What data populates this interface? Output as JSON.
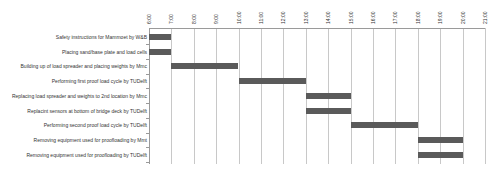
{
  "chart_data": {
    "type": "bar",
    "subtype": "gantt",
    "title": "",
    "xlabel": "",
    "ylabel": "",
    "x_ticks": [
      "6:00",
      "7:00",
      "8:00",
      "9:00",
      "10:00",
      "11:00",
      "12:00",
      "13:00",
      "14:00",
      "15:00",
      "16:00",
      "17:00",
      "18:00",
      "19:00",
      "20:00",
      "21:00"
    ],
    "xlim": [
      6,
      21
    ],
    "grid": true,
    "legend": null,
    "bar_color": "#5a5a5a",
    "tasks": [
      {
        "label": "Safety instructions for Mammoet by W&B",
        "start": 6,
        "end": 7
      },
      {
        "label": "Placing sand/base plate and load cells",
        "start": 6,
        "end": 7
      },
      {
        "label": "Building up of load spreader and placing weights by Mmc",
        "start": 7,
        "end": 10
      },
      {
        "label": "Performing first proof load cycle by TUDelft",
        "start": 10,
        "end": 13
      },
      {
        "label": "Replacing load spreader and weights to 2nd location by Mmc",
        "start": 13,
        "end": 15
      },
      {
        "label": "Replacint sensors at bottom of bridge deck by TUDelft",
        "start": 13,
        "end": 15
      },
      {
        "label": "Performing second proof load cycle by TUDelft",
        "start": 15,
        "end": 18
      },
      {
        "label": "Removing equipment used for proofloading by Mmt",
        "start": 18,
        "end": 20
      },
      {
        "label": "Removing equipment used for proofloading by TUDelft",
        "start": 18,
        "end": 20
      }
    ]
  }
}
